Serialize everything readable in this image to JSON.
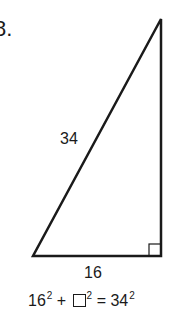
{
  "problem": {
    "number": "8."
  },
  "triangle": {
    "hypotenuse_label": "34",
    "base_label": "16",
    "right_angle_marker": "right-angle-square"
  },
  "equation": {
    "term1_base": "16",
    "term1_exp": "2",
    "plus": "+",
    "term2_exp": "2",
    "equals": "=",
    "rhs_base": "34",
    "rhs_exp": "2"
  }
}
